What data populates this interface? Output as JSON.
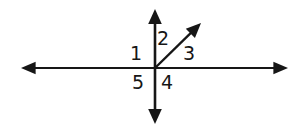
{
  "figure": {
    "background_color": "#ffffff",
    "stroke_color": "#161616",
    "label_color": "#161616",
    "canvas": {
      "width": 306,
      "height": 133
    },
    "origin": {
      "x": 155,
      "y": 68
    }
  },
  "lines": [
    {
      "id": "horizontal-line",
      "name": "horizontal-double-arrow-line",
      "x1": 21,
      "y1": 68,
      "x2": 288,
      "y2": 68,
      "stroke_width": 2.2,
      "arrow_start": true,
      "arrow_end": true
    },
    {
      "id": "vertical-line",
      "name": "vertical-double-arrow-line",
      "x1": 155,
      "y1": 9,
      "x2": 155,
      "y2": 124,
      "stroke_width": 2.6,
      "arrow_start": true,
      "arrow_end": true
    },
    {
      "id": "diagonal-ray",
      "name": "diagonal-ray-up-right",
      "x1": 155,
      "y1": 68,
      "x2": 201,
      "y2": 23,
      "stroke_width": 2.4,
      "arrow_start": false,
      "arrow_end": true
    }
  ],
  "labels": [
    {
      "id": "label-1",
      "text": "1",
      "x": 130,
      "y": 44,
      "region": "between-left-ray-and-up-ray"
    },
    {
      "id": "label-2",
      "text": "2",
      "x": 157,
      "y": 29,
      "region": "between-up-ray-and-diagonal-ray"
    },
    {
      "id": "label-3",
      "text": "3",
      "x": 183,
      "y": 44,
      "region": "between-diagonal-ray-and-right-ray"
    },
    {
      "id": "label-4",
      "text": "4",
      "x": 161,
      "y": 73,
      "region": "between-right-ray-and-down-ray"
    },
    {
      "id": "label-5",
      "text": "5",
      "x": 132,
      "y": 73,
      "region": "between-down-ray-and-left-ray"
    }
  ]
}
